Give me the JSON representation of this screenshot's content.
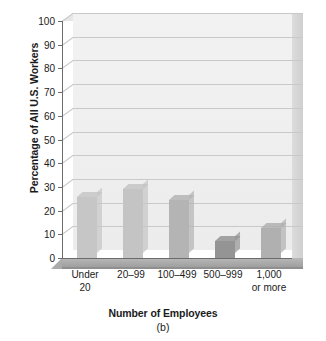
{
  "chart_data": {
    "type": "bar",
    "title": "",
    "xlabel": "Number of Employees",
    "ylabel": "Percentage of All U.S. Workers",
    "caption": "(b)",
    "categories": [
      "Under 20",
      "20–99",
      "100–499",
      "500–999",
      "1,000 or more"
    ],
    "values": [
      25.7,
      29.0,
      24.5,
      7.0,
      12.6
    ],
    "ylim": [
      0,
      100
    ],
    "yticks": [
      0,
      10,
      20,
      30,
      40,
      50,
      60,
      70,
      80,
      90,
      100
    ],
    "ytick_labels": [
      "0",
      "10",
      "20",
      "30",
      "40",
      "50",
      "60",
      "70",
      "80",
      "90",
      "100"
    ],
    "grid": true,
    "legend": false,
    "style": "3d-bar",
    "bar_colors": [
      "#c6c6c6",
      "#c4c4c4",
      "#b4b4b4",
      "#949494",
      "#b0b0b0"
    ],
    "plot_background": "#efefef",
    "gridline_color": "#c9c9c9",
    "axis_color": "#6b6b6b"
  },
  "axes": {
    "y_title": "Percentage of All U.S. Workers",
    "x_title": "Number of Employees",
    "caption": "(b)"
  },
  "x_tick_labels": [
    {
      "line1": "Under",
      "line2": "20"
    },
    {
      "line1": "20–99",
      "line2": ""
    },
    {
      "line1": "100–499",
      "line2": ""
    },
    {
      "line1": "500–999",
      "line2": ""
    },
    {
      "line1": "1,000",
      "line2": "or more"
    }
  ]
}
